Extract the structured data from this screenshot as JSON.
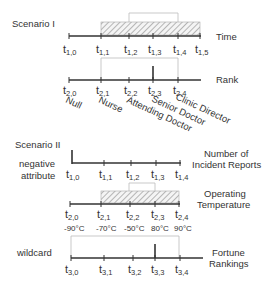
{
  "scenario1": {
    "title": "Scenario I",
    "time_axis": {
      "label": "Time",
      "ticks": [
        {
          "base": "t",
          "sub": "1,0"
        },
        {
          "base": "t",
          "sub": "1,1"
        },
        {
          "base": "t",
          "sub": "1,2"
        },
        {
          "base": "t",
          "sub": "1,3"
        },
        {
          "base": "t",
          "sub": "1,4"
        },
        {
          "base": "t",
          "sub": "1,5"
        }
      ]
    },
    "rank_axis": {
      "label": "Rank",
      "ticks": [
        {
          "base": "t",
          "sub": "2,0"
        },
        {
          "base": "t",
          "sub": "2,1"
        },
        {
          "base": "t",
          "sub": "2,2"
        },
        {
          "base": "t",
          "sub": "2,3"
        },
        {
          "base": "t",
          "sub": "2,4"
        }
      ],
      "categories": [
        "Null",
        "Nurse",
        "Attending Doctor",
        "Senior Doctor",
        "Clinic Director"
      ]
    }
  },
  "scenario2": {
    "title": "Scenario II",
    "negative": {
      "side_label_1": "negative",
      "side_label_2": "attribute",
      "axis_label_1": "Number of",
      "axis_label_2": "Incident Reports",
      "ticks": [
        {
          "base": "t",
          "sub": "1,0"
        },
        {
          "base": "t",
          "sub": "1,1"
        },
        {
          "base": "t",
          "sub": "1,2"
        },
        {
          "base": "t",
          "sub": "1,3"
        },
        {
          "base": "t",
          "sub": "1,4"
        }
      ]
    },
    "temperature": {
      "axis_label_1": "Operating",
      "axis_label_2": "Temperature",
      "ticks": [
        {
          "base": "t",
          "sub": "2,0"
        },
        {
          "base": "t",
          "sub": "2,1"
        },
        {
          "base": "t",
          "sub": "2,2"
        },
        {
          "base": "t",
          "sub": "2,3"
        },
        {
          "base": "t",
          "sub": "2,4"
        }
      ],
      "values": [
        "-90°C",
        "-70°C",
        "-50°C",
        "80°C",
        "90°C"
      ]
    },
    "wildcard": {
      "side_label": "wildcard",
      "axis_label_1": "Fortune",
      "axis_label_2": "Rankings",
      "ticks": [
        {
          "base": "t",
          "sub": "3,0"
        },
        {
          "base": "t",
          "sub": "3,1"
        },
        {
          "base": "t",
          "sub": "3,2"
        },
        {
          "base": "t",
          "sub": "3,3"
        },
        {
          "base": "t",
          "sub": "3,4"
        }
      ]
    }
  },
  "colors": {
    "axis": "#333333",
    "light_box": "#bbbbbb",
    "hatch": "#999999"
  }
}
